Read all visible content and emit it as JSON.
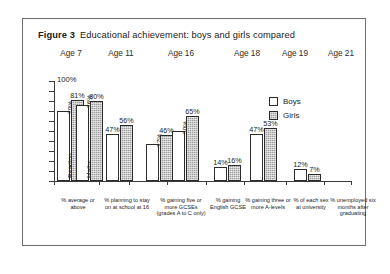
{
  "figure": {
    "number_label": "Figure 3",
    "title": "Educational achievement: boys and girls compared"
  },
  "legend": {
    "boys_label": "Boys",
    "girls_label": "Girls",
    "boys_color": "#ffffff",
    "girls_color": "#9e9e9e",
    "outline_color": "#2b2b2b"
  },
  "axis": {
    "y_top_label": "100%",
    "y_max": 100,
    "y_min": 0
  },
  "age_bands": [
    {
      "label": "Age 7"
    },
    {
      "label": "Age 11"
    },
    {
      "label": "Age 16"
    },
    {
      "label": "Age 18"
    },
    {
      "label": "Age 19"
    },
    {
      "label": "Age 21"
    }
  ],
  "chart_data": {
    "type": "bar",
    "title": "Educational achievement: boys and girls compared",
    "xlabel": "",
    "ylabel": "",
    "ylim": [
      0,
      100
    ],
    "grid": false,
    "legend_position": "right",
    "series": [
      {
        "name": "Boys",
        "values": [
          70,
          76,
          47,
          37,
          50,
          14,
          47,
          12
        ]
      },
      {
        "name": "Girls",
        "values": [
          81,
          80,
          56,
          46,
          65,
          16,
          53,
          7
        ]
      }
    ],
    "categories": [
      "% average or above (Reading)",
      "% average or above (Maths)",
      "% planning to stay on at school at 16",
      "% gaining five or more GCSEs (grades A to C only)",
      "% gaining English GCSE",
      "% gaining three or more A-levels",
      "% of each sex at university",
      "% unemployed six months after graduating"
    ],
    "value_labels": [
      "70%",
      "76%",
      "47%",
      "37%",
      "50%",
      "14%",
      "47%",
      "12%",
      "81%",
      "80%",
      "56%",
      "46%",
      "65%",
      "16%",
      "53%",
      "7%"
    ]
  },
  "bars": [
    {
      "id": "b0",
      "series": "Boys",
      "value": 70,
      "label": "70%",
      "label_pos": "inside",
      "inner_name": "Reading"
    },
    {
      "id": "g0",
      "series": "Girls",
      "value": 81,
      "label": "81%",
      "label_pos": "outside",
      "inner_name": ""
    },
    {
      "id": "b1",
      "series": "Boys",
      "value": 76,
      "label": "76%",
      "label_pos": "inside",
      "inner_name": "Maths"
    },
    {
      "id": "g1",
      "series": "Girls",
      "value": 80,
      "label": "80%",
      "label_pos": "outside",
      "inner_name": ""
    },
    {
      "id": "b2",
      "series": "Boys",
      "value": 47,
      "label": "47%",
      "label_pos": "outside",
      "inner_name": ""
    },
    {
      "id": "g2",
      "series": "Girls",
      "value": 56,
      "label": "56%",
      "label_pos": "outside",
      "inner_name": ""
    },
    {
      "id": "b3",
      "series": "Boys",
      "value": 37,
      "label": "37%",
      "label_pos": "inside",
      "inner_name": ""
    },
    {
      "id": "g3",
      "series": "Girls",
      "value": 46,
      "label": "46%",
      "label_pos": "outside",
      "inner_name": ""
    },
    {
      "id": "b4",
      "series": "Boys",
      "value": 50,
      "label": "50%",
      "label_pos": "inside",
      "inner_name": ""
    },
    {
      "id": "g4",
      "series": "Girls",
      "value": 65,
      "label": "65%",
      "label_pos": "outside",
      "inner_name": ""
    },
    {
      "id": "b5",
      "series": "Boys",
      "value": 14,
      "label": "14%",
      "label_pos": "outside",
      "inner_name": ""
    },
    {
      "id": "g5",
      "series": "Girls",
      "value": 16,
      "label": "16%",
      "label_pos": "outside",
      "inner_name": ""
    },
    {
      "id": "b6",
      "series": "Boys",
      "value": 47,
      "label": "47%",
      "label_pos": "outside",
      "inner_name": ""
    },
    {
      "id": "g6",
      "series": "Girls",
      "value": 53,
      "label": "53%",
      "label_pos": "outside",
      "inner_name": ""
    },
    {
      "id": "b7",
      "series": "Boys",
      "value": 12,
      "label": "12%",
      "label_pos": "outside",
      "inner_name": ""
    },
    {
      "id": "g7",
      "series": "Girls",
      "value": 7,
      "label": "7%",
      "label_pos": "outside",
      "inner_name": ""
    }
  ],
  "category_captions": [
    {
      "text": "% average or above"
    },
    {
      "text": "% planning to stay on at school at 16"
    },
    {
      "text": "% gaining five or more GCSEs (grades A to C only)"
    },
    {
      "text": "% gaining English GCSE"
    },
    {
      "text": "% gaining three or more A-levels"
    },
    {
      "text": "% of each sex at university"
    },
    {
      "text": "% unemployed six months after graduating"
    }
  ]
}
